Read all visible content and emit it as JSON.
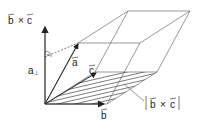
{
  "diagram": {
    "labels": {
      "axis": "b × c",
      "axis_b": "b",
      "axis_x": "×",
      "axis_c": "c",
      "a": "a",
      "b": "b",
      "c": "c",
      "height": "a",
      "height_sub": "⊥",
      "area_b": "b",
      "area_x": "×",
      "area_c": "c"
    },
    "colors": {
      "line": "#333333",
      "hatch": "#444444",
      "background": "#ffffff"
    }
  }
}
